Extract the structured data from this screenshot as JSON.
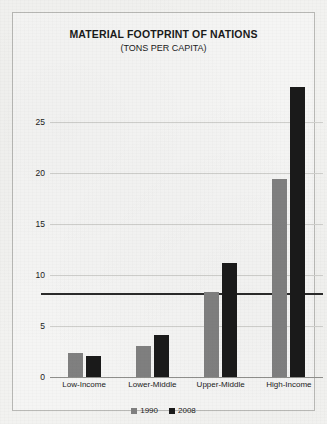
{
  "chart_data": {
    "type": "bar",
    "title": "MATERIAL FOOTPRINT OF NATIONS",
    "subtitle": "(TONS PER CAPITA)",
    "xlabel": "",
    "ylabel": "",
    "categories": [
      "Low-Income",
      "Lower-Middle",
      "Upper-Middle",
      "High-Income"
    ],
    "series": [
      {
        "name": "1990",
        "color": "#808080",
        "values": [
          2.4,
          3.0,
          8.3,
          19.4
        ]
      },
      {
        "name": "2008",
        "color": "#1a1a1a",
        "values": [
          2.1,
          4.1,
          11.2,
          28.4
        ]
      }
    ],
    "ylim": [
      0,
      30
    ],
    "yticks": [
      0,
      5,
      10,
      15,
      20,
      25
    ],
    "ytick_labels": [
      "0",
      "5",
      "10",
      "15",
      "20",
      "25"
    ],
    "grid": true,
    "legend_position": "bottom",
    "annotations": [
      {
        "name": "world-average-reference-line",
        "type": "hline",
        "value": 8.2,
        "color": "#2b2b2b"
      }
    ]
  }
}
